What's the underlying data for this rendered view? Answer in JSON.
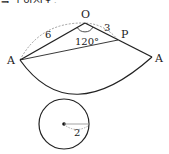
{
  "header": {
    "cut_text": "를 구하시오."
  },
  "diagram": {
    "labels": {
      "O": "O",
      "P": "P",
      "A_left": "A",
      "A_right": "A",
      "OA_length": "6",
      "OP_length": "3",
      "angle": "120°",
      "radius": "2"
    },
    "colors": {
      "stroke": "#222222",
      "dashed": "#888888"
    }
  }
}
